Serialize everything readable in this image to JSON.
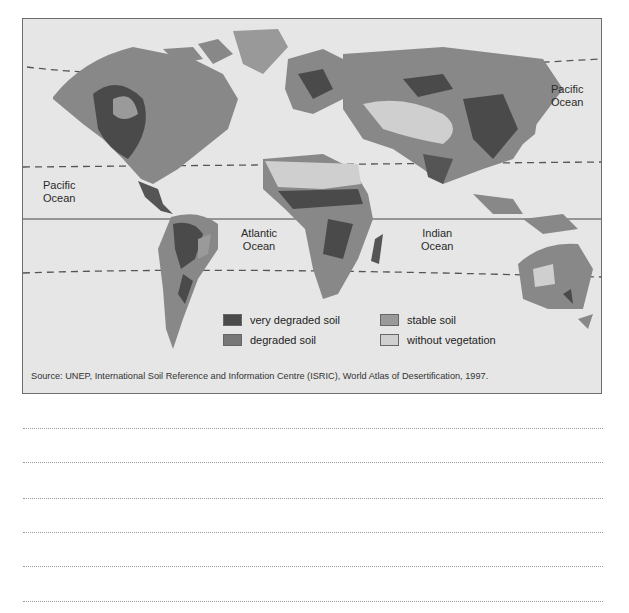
{
  "map": {
    "title": "World map of soil degradation",
    "ocean_labels": [
      {
        "line1": "Pacific",
        "line2": "Ocean",
        "position": "east"
      },
      {
        "line1": "Pacific",
        "line2": "Ocean",
        "position": "west"
      },
      {
        "line1": "Atlantic",
        "line2": "Ocean",
        "position": "center"
      },
      {
        "line1": "Indian",
        "line2": "Ocean",
        "position": "south-east"
      }
    ],
    "legend": [
      {
        "label": "very degraded soil",
        "color": "#4a4a4a"
      },
      {
        "label": "stable soil",
        "color": "#9a9a9a"
      },
      {
        "label": "degraded soil",
        "color": "#777777"
      },
      {
        "label": "without vegetation",
        "color": "#cfcfcf"
      }
    ],
    "source": "Source: UNEP, International Soil Reference and Information Centre (ISRIC), World Atlas of Desertification, 1997.",
    "colors": {
      "ocean": "#e6e6e6",
      "very_degraded": "#4a4a4a",
      "degraded": "#777777",
      "stable": "#9a9a9a",
      "without_vegetation": "#cfcfcf",
      "frame": "#6e6e6e"
    }
  },
  "answer_lines": {
    "count": 6,
    "style": "dotted"
  }
}
